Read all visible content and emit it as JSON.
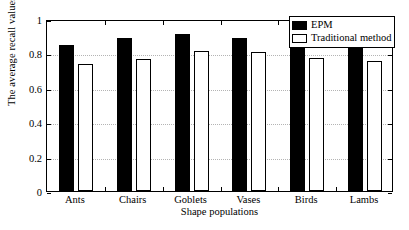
{
  "chart_data": {
    "type": "bar",
    "title": "",
    "xlabel": "Shape populations",
    "ylabel": "The average recall values",
    "categories": [
      "Ants",
      "Chairs",
      "Goblets",
      "Vases",
      "Birds",
      "Lambs"
    ],
    "series": [
      {
        "name": "EPM",
        "color": "#000000",
        "fill": "solid",
        "values": [
          0.85,
          0.89,
          0.91,
          0.89,
          0.86,
          0.85
        ]
      },
      {
        "name": "Traditional method",
        "color": "#ffffff",
        "fill": "outline",
        "values": [
          0.74,
          0.765,
          0.815,
          0.81,
          0.775,
          0.755
        ]
      }
    ],
    "ylim": [
      0,
      1
    ],
    "yticks": [
      0,
      0.2,
      0.4,
      0.6,
      0.8,
      1
    ],
    "ytick_labels": [
      "0",
      "0.2",
      "0.4",
      "0.6",
      "0.8",
      "1"
    ],
    "grid": true,
    "grid_style": "dotted",
    "grid_color": "#b4b4b4",
    "legend_position": "top-right",
    "axis_color": "#000000",
    "background": "#ffffff"
  },
  "legend": {
    "items": [
      {
        "label": "EPM",
        "swatch": "legend-swatch-epm"
      },
      {
        "label": "Traditional method",
        "swatch": "legend-swatch-traditional"
      }
    ]
  }
}
